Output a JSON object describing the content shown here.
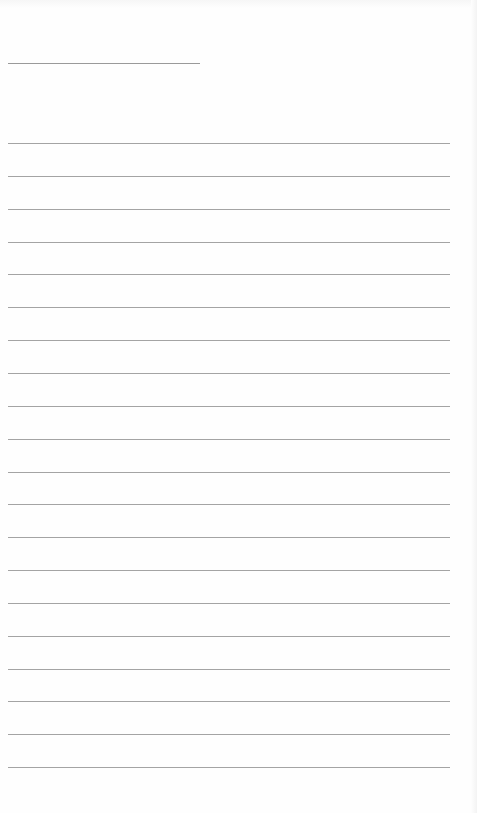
{
  "page": {
    "type": "lined-paper",
    "background_color": "#fefefe",
    "line_color": "#a4a4a4",
    "header_line": {
      "x": 8,
      "y": 63,
      "width": 192
    },
    "writing_lines": {
      "count": 20,
      "x": 8,
      "first_y": 143,
      "spacing": 32.85,
      "width": 442
    },
    "text": []
  }
}
